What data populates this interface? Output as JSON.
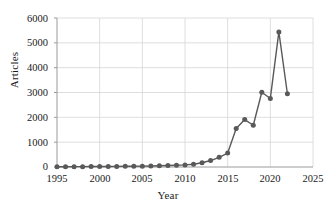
{
  "chart_data": {
    "type": "line",
    "title": "",
    "xlabel": "Year",
    "ylabel": "Articles",
    "xlim": [
      1995,
      2025
    ],
    "ylim": [
      0,
      6000
    ],
    "xticks": [
      "1995",
      "2000",
      "2005",
      "2010",
      "2015",
      "2020",
      "2025"
    ],
    "yticks": [
      "0",
      "1000",
      "2000",
      "3000",
      "4000",
      "5000",
      "6000"
    ],
    "grid": "horizontal",
    "legend": "none",
    "marker": "circle",
    "series_color": "#595959",
    "x": [
      1995,
      1996,
      1997,
      1998,
      1999,
      2000,
      2001,
      2002,
      2003,
      2004,
      2005,
      2006,
      2007,
      2008,
      2009,
      2010,
      2011,
      2012,
      2013,
      2014,
      2015,
      2016,
      2017,
      2018,
      2019,
      2020,
      2021,
      2022
    ],
    "values": [
      10,
      12,
      14,
      15,
      18,
      20,
      22,
      25,
      28,
      30,
      35,
      40,
      48,
      60,
      72,
      85,
      110,
      170,
      260,
      390,
      560,
      1550,
      1910,
      1680,
      3010,
      2760,
      5440,
      2950
    ]
  }
}
